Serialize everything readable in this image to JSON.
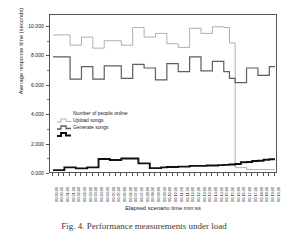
{
  "figure": {
    "caption": "Fig. 4.  Performance measurements under load",
    "background": "#ffffff"
  },
  "chart_data": {
    "type": "line",
    "title": "",
    "xlabel": "Elapsed scenario time mm:ss",
    "ylabel": "Average response time (seconds)",
    "ylim": [
      0.0,
      10.8
    ],
    "yticks": [
      "0.000",
      "2.000",
      "4.000",
      "6.000",
      "8.000",
      "10.000"
    ],
    "ytick_values": [
      0.0,
      2.0,
      4.0,
      6.0,
      8.0,
      10.0
    ],
    "grid": false,
    "legend_position": "center-left",
    "step_style": "post",
    "colors": {
      "number_of_people_online": "#9a9a9a",
      "upload_songs": "#5e5e5e",
      "generate_songs": "#111111",
      "axis": "#555555",
      "text": "#1a1a1a"
    },
    "x": [
      "00:00:00",
      "00:00:30",
      "00:01:00",
      "00:01:30",
      "00:02:00",
      "00:02:30",
      "00:03:00",
      "00:03:30",
      "00:04:00",
      "00:04:30",
      "00:05:00",
      "00:05:30",
      "00:06:00",
      "00:06:30",
      "00:07:00",
      "00:07:30",
      "00:08:00",
      "00:08:30",
      "00:09:00",
      "00:09:30",
      "00:10:00",
      "00:10:30",
      "00:11:00",
      "00:11:30",
      "00:12:00",
      "00:12:30",
      "00:13:00",
      "00:13:30",
      "00:14:00",
      "00:14:30",
      "00:15:00",
      "00:15:30",
      "00:16:00",
      "00:16:30",
      "00:17:00",
      "00:17:30",
      "00:18:00",
      "00:18:30",
      "00:19:00",
      "00:19:30"
    ],
    "xtick_labels": [
      "00:00:00",
      "00:00:30",
      "00:01:00",
      "00:01:30",
      "00:02:00",
      "00:02:30",
      "00:03:00",
      "00:03:30",
      "00:04:00",
      "00:04:30",
      "00:05:00",
      "00:05:30",
      "00:06:00",
      "00:06:30",
      "00:07:00",
      "00:07:30",
      "00:08:00",
      "00:08:30",
      "00:09:00",
      "00:09:30",
      "00:10:00",
      "00:10:30",
      "00:11:00",
      "00:11:30",
      "00:12:00",
      "00:12:30",
      "00:13:00",
      "00:13:30",
      "00:14:00",
      "00:14:30",
      "00:15:00",
      "00:15:30",
      "00:16:00",
      "00:16:30",
      "00:17:00",
      "00:17:30",
      "00:18:00",
      "00:18:30",
      "00:19:00",
      "00:19:30"
    ],
    "series": [
      {
        "name": "Number of people online",
        "color": "#9a9a9a",
        "width": 0.8,
        "values": [
          9.45,
          9.45,
          9.45,
          8.75,
          8.75,
          9.3,
          9.3,
          8.55,
          8.55,
          9.05,
          9.05,
          9.05,
          8.75,
          8.75,
          9.95,
          9.95,
          9.3,
          9.3,
          9.55,
          9.55,
          8.85,
          8.85,
          8.6,
          8.6,
          9.9,
          9.9,
          9.55,
          9.55,
          10.0,
          10.0,
          9.95,
          8.9,
          0.45,
          0.45,
          0.3,
          0.3,
          0.3,
          0.3,
          0.3,
          0.3
        ]
      },
      {
        "name": "Upload songs",
        "color": "#5e5e5e",
        "width": 1.2,
        "values": [
          7.95,
          7.95,
          7.95,
          6.45,
          6.45,
          7.3,
          7.3,
          6.45,
          6.45,
          7.35,
          7.35,
          7.35,
          6.5,
          6.5,
          7.45,
          7.45,
          7.2,
          7.2,
          6.4,
          6.4,
          7.5,
          7.5,
          6.95,
          6.95,
          7.95,
          7.95,
          7.0,
          7.0,
          7.65,
          7.65,
          6.95,
          6.5,
          6.2,
          6.2,
          7.2,
          7.2,
          6.7,
          6.7,
          7.3,
          7.3
        ]
      },
      {
        "name": "Generate songs",
        "color": "#111111",
        "width": 1.9,
        "values": [
          0.26,
          0.26,
          0.45,
          0.45,
          0.38,
          0.38,
          0.45,
          0.45,
          1.02,
          1.02,
          0.95,
          0.95,
          1.05,
          1.05,
          1.05,
          0.72,
          0.72,
          0.4,
          0.4,
          0.45,
          0.48,
          0.48,
          0.5,
          0.5,
          0.55,
          0.55,
          0.55,
          0.58,
          0.58,
          0.6,
          0.62,
          0.65,
          0.68,
          0.8,
          0.82,
          0.88,
          0.9,
          0.97,
          1.0,
          1.0
        ]
      }
    ]
  },
  "legend": {
    "items": [
      {
        "label": "Number of people online",
        "color": "#9a9a9a",
        "width": 0.8
      },
      {
        "label": "Upload songs",
        "color": "#5e5e5e",
        "width": 1.3
      },
      {
        "label": "Generate songs",
        "color": "#111111",
        "width": 2.0
      }
    ]
  }
}
